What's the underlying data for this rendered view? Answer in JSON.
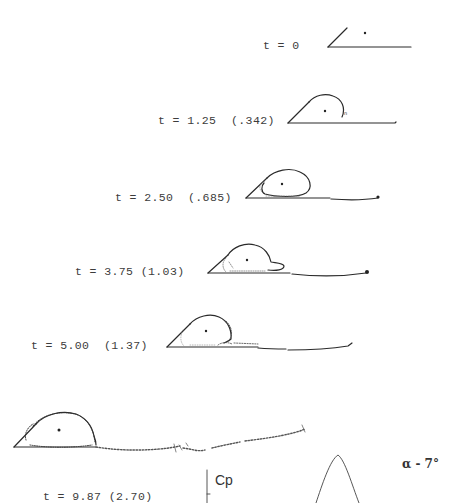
{
  "figure": {
    "panels": [
      {
        "time": "t = 0",
        "scaled": "",
        "label": "t = 0"
      },
      {
        "time": "t = 1.25",
        "scaled": "(.342)",
        "label": "t = 1.25  (.342)"
      },
      {
        "time": "t = 2.50",
        "scaled": "(.685)",
        "label": "t = 2.50  (.685)"
      },
      {
        "time": "t = 3.75",
        "scaled": "(1.03)",
        "label": "t = 3.75 (1.03)"
      },
      {
        "time": "t = 5.00",
        "scaled": "(1.37)",
        "label": "t = 5.00  (1.37)"
      },
      {
        "time": "t = 9.87",
        "scaled": "(2.70)",
        "label": "t = 9.87 (2.70)"
      }
    ],
    "cp_plot": {
      "axis_label": "Cp",
      "alpha_label": "α - 7°"
    }
  }
}
